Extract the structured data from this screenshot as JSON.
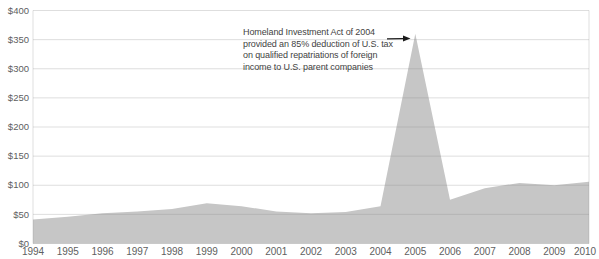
{
  "colors": {
    "background": "#ffffff",
    "area_fill": "#c6c6c6",
    "gridline": "#8a8a8a",
    "axis_text": "#606060",
    "annotation_text": "#3f3f3f",
    "arrow": "#1a1a1a"
  },
  "chart_data": {
    "type": "area",
    "title": "",
    "xlabel": "",
    "ylabel": "",
    "categories": [
      "1994",
      "1995",
      "1996",
      "1997",
      "1998",
      "1999",
      "2000",
      "2001",
      "2002",
      "2003",
      "2004",
      "2005",
      "2006",
      "2007",
      "2008",
      "2009",
      "2010"
    ],
    "values": [
      41,
      46,
      52,
      55,
      59,
      69,
      64,
      55,
      52,
      54,
      64,
      360,
      75,
      95,
      104,
      100,
      106
    ],
    "ylim": [
      0,
      400
    ],
    "yticks": [
      0,
      50,
      100,
      150,
      200,
      250,
      300,
      350,
      400
    ],
    "ytick_prefix": "$",
    "grid": true,
    "legend": false,
    "annotation": {
      "lines": [
        "Homeland Investment Act of 2004",
        "provided an 85% deduction of U.S. tax",
        "on qualified repatriations of foreign",
        "income to U.S. parent companies"
      ],
      "arrow_target": "2005-peak"
    }
  }
}
